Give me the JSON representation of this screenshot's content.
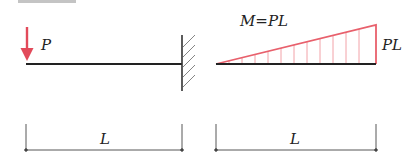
{
  "title_fragment": "弯矩图",
  "colors": {
    "load": "#e24a5a",
    "moment": "#e8606c",
    "moment_hatch": "#ef8a93",
    "beam": "#222222",
    "support": "#333333",
    "dimension": "#444444"
  },
  "left_figure": {
    "load_label": "P",
    "span_label": "L",
    "support": "fixed-wall"
  },
  "right_figure": {
    "formula_label": "M=PL",
    "end_value_label": "PL",
    "span_label": "L",
    "hatch_lines": 12
  }
}
